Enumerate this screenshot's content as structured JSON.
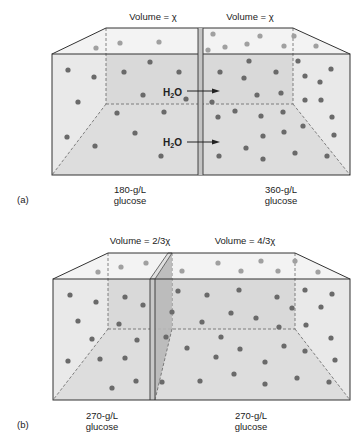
{
  "panel_a": {
    "tag": "(a)",
    "left_volume": "Volume = χ",
    "right_volume": "Volume = χ",
    "arrow_label_1": "H",
    "arrow_label_2": "H",
    "sub": "2",
    "o": "O",
    "left_conc": "180-g/L",
    "right_conc": "360-g/L",
    "solute_left": "glucose",
    "solute_right": "glucose"
  },
  "panel_b": {
    "tag": "(b)",
    "left_volume": "Volume = 2/3χ",
    "right_volume": "Volume = 4/3χ",
    "left_conc": "270-g/L",
    "right_conc": "270-g/L",
    "solute_left": "glucose",
    "solute_right": "glucose"
  },
  "colors": {
    "box_fill": "#e8e8e8",
    "back_wall": "#d6d6d6",
    "floor": "#dcdcdc",
    "top_fill": "#f2f2f2",
    "molecule": "#6a6a6a",
    "molecule_far": "#a0a0a0",
    "edge": "#333333",
    "partition_fill": "#b8b8b8"
  }
}
